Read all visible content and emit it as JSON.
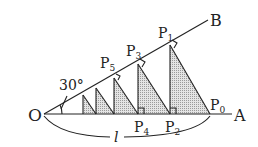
{
  "diagram": {
    "labels": {
      "O": "O",
      "A": "A",
      "B": "B",
      "angle": "30°",
      "length": "l",
      "P0": "P",
      "P0_sub": "0",
      "P1": "P",
      "P1_sub": "1",
      "P2": "P",
      "P2_sub": "2",
      "P3": "P",
      "P3_sub": "3",
      "P4": "P",
      "P4_sub": "4",
      "P5": "P",
      "P5_sub": "5"
    },
    "colors": {
      "line": "#222222",
      "fill": "#d4d4d4"
    }
  }
}
